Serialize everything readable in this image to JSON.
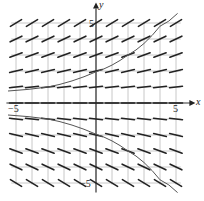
{
  "chart_data": {
    "type": "slope_field",
    "title": "",
    "xlabel": "x",
    "ylabel": "y",
    "xlim": [
      -5,
      5
    ],
    "ylim": [
      -5,
      5
    ],
    "grid": true,
    "tick_labels": {
      "x_min": "-5",
      "x_max": "5",
      "y_max": "5",
      "y_min": "-5"
    },
    "slope_rule": "slope depends on y only; zero along y=0, increasing in magnitude with |y| (approx dy/dx = 0.12*y)",
    "sample_points_x": [
      -5,
      -4,
      -3,
      -2,
      -1,
      0,
      1,
      2,
      3,
      4,
      5
    ],
    "sample_points_y": [
      5,
      4,
      3,
      2,
      1,
      0,
      -1,
      -2,
      -3,
      -4,
      -5
    ],
    "solution_curves": [
      {
        "name": "upper",
        "points": [
          [
            -5.5,
            0.75
          ],
          [
            -3,
            1.0
          ],
          [
            0,
            1.95
          ],
          [
            2,
            3.0
          ],
          [
            4,
            4.8
          ],
          [
            5.1,
            5.6
          ]
        ]
      },
      {
        "name": "lower",
        "points": [
          [
            -5.5,
            -0.75
          ],
          [
            -3,
            -1.0
          ],
          [
            0,
            -1.95
          ],
          [
            2,
            -3.0
          ],
          [
            4,
            -4.8
          ],
          [
            5.1,
            -5.6
          ]
        ]
      }
    ]
  },
  "labels": {
    "x_axis": "x",
    "y_axis": "y",
    "x_min": "−5",
    "x_max": "5",
    "y_max": "5",
    "y_min": "−5"
  }
}
